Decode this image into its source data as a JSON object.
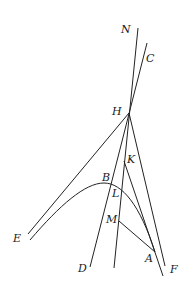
{
  "diagram": {
    "labels": {
      "N": "N",
      "C": "C",
      "H": "H",
      "K": "K",
      "B": "B",
      "L": "L",
      "M": "M",
      "E": "E",
      "D": "D",
      "A": "A",
      "F": "F"
    },
    "colors": {
      "stroke": "#222222",
      "text": "#1a1a1a",
      "background": "#ffffff"
    }
  }
}
